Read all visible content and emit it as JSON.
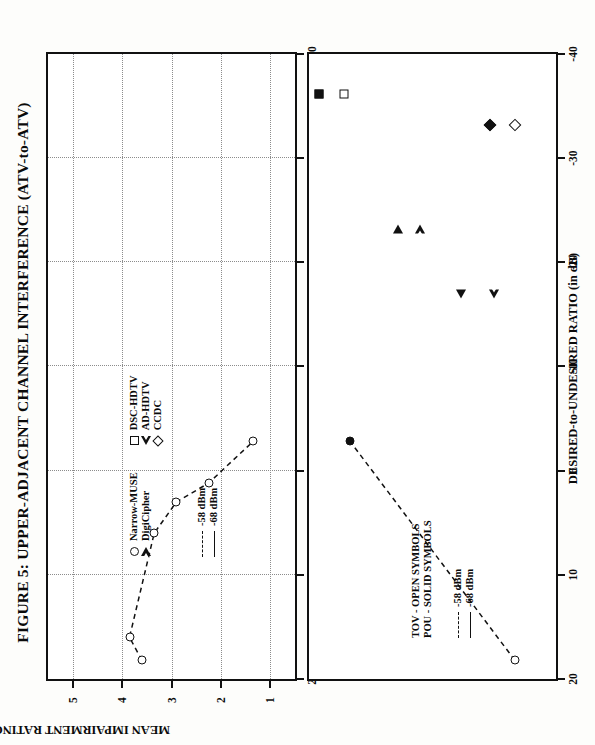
{
  "figure": {
    "title": "FIGURE 5:  UPPER-ADJACENT CHANNEL INTERFERENCE (ATV-to-ATV)"
  },
  "top_panel": {
    "y_axis_title": "MEAN IMPAIRMENT RATING",
    "y_ticks": [
      "1",
      "2",
      "3",
      "4",
      "5"
    ],
    "x_ticks": [
      "20",
      "10",
      "0",
      "-10",
      "-20",
      "-30",
      "-40"
    ],
    "legend_symbols": [
      {
        "label": "Narrow-MUSE",
        "symbol": "circle-open"
      },
      {
        "label": "DigiCipher",
        "symbol": "triangle-right-open"
      },
      {
        "label": "DSC-HDTV",
        "symbol": "square-open"
      },
      {
        "label": "AD-HDTV",
        "symbol": "triangle-left-open"
      },
      {
        "label": "CCDC",
        "symbol": "diamond-open"
      }
    ],
    "legend_lines": [
      {
        "label": "-58 dBm",
        "style": "dashed"
      },
      {
        "label": "-68 dBm",
        "style": "solid"
      }
    ]
  },
  "bottom_panel": {
    "x_axis_title": "DESIRED-to-UNDESIRED RATIO (in dB)",
    "x_ticks": [
      "20",
      "10",
      "0",
      "-10",
      "-20",
      "-30",
      "-40"
    ],
    "y_ticks": [
      "1",
      "2",
      "3",
      "4",
      "5"
    ],
    "legend_notes": [
      "TOV - OPEN SYMBOLS",
      "POU - SOLID SYMBOLS"
    ],
    "legend_lines": [
      {
        "label": "-58 dBm",
        "style": "dashed"
      },
      {
        "label": "-68 dBm",
        "style": "solid"
      }
    ]
  },
  "chart_data": [
    {
      "type": "line",
      "panel": "top",
      "title": "Mean impairment rating vs desired-to-undesired ratio",
      "xlabel": "DESIRED-to-UNDESIRED RATIO (in dB)",
      "ylabel": "MEAN IMPAIRMENT RATING",
      "xlim": [
        20,
        -40
      ],
      "ylim": [
        0.5,
        5.5
      ],
      "grid": "dotted vertical and horizontal",
      "legend_position": "lower-left inside axes",
      "series": [
        {
          "name": "Narrow-MUSE -58 dBm",
          "marker": "circle-open",
          "line": "dashed",
          "points": [
            {
              "x": 18.2,
              "y": 3.6
            },
            {
              "x": 16.0,
              "y": 3.85
            },
            {
              "x": 6.0,
              "y": 3.35
            },
            {
              "x": 3.0,
              "y": 2.9
            },
            {
              "x": 1.2,
              "y": 2.25
            },
            {
              "x": -2.8,
              "y": 1.35
            }
          ]
        }
      ]
    },
    {
      "type": "scatter",
      "panel": "bottom",
      "title": "TOV and POU thresholds vs desired-to-undesired ratio",
      "xlabel": "DESIRED-to-UNDESIRED RATIO (in dB)",
      "ylabel": "",
      "xlim": [
        20,
        -40
      ],
      "ylim": [
        0,
        6
      ],
      "grid": "off",
      "legend_position": "lower-left inside axes",
      "series": [
        {
          "name": "Narrow-MUSE",
          "marker_open": "circle-open",
          "marker_solid": "circle-solid",
          "line": "dashed",
          "points": [
            {
              "x": 18.2,
              "y": 1.0,
              "kind": "TOV"
            },
            {
              "x": -2.8,
              "y": 5.0,
              "kind": "POU"
            }
          ]
        },
        {
          "name": "DigiCipher",
          "marker_open": "triangle-right-open",
          "marker_solid": "triangle-right-solid",
          "points": [
            {
              "x": -23.2,
              "y": 3.3,
              "kind": "TOV"
            },
            {
              "x": -23.2,
              "y": 3.85,
              "kind": "POU"
            }
          ]
        },
        {
          "name": "AD-HDTV",
          "marker_open": "triangle-left-open",
          "marker_solid": "triangle-left-solid",
          "points": [
            {
              "x": -17.0,
              "y": 1.75,
              "kind": "TOV"
            },
            {
              "x": -17.0,
              "y": 2.3,
              "kind": "POU"
            }
          ]
        },
        {
          "name": "DSC-HDTV",
          "marker_open": "square-open",
          "marker_solid": "square-solid",
          "points": [
            {
              "x": -36.2,
              "y": 5.15,
              "kind": "TOV"
            },
            {
              "x": -36.2,
              "y": 5.75,
              "kind": "POU"
            }
          ]
        },
        {
          "name": "CCDC",
          "marker_open": "diamond-open",
          "marker_solid": "diamond-solid",
          "points": [
            {
              "x": -33.2,
              "y": 1.0,
              "kind": "TOV"
            },
            {
              "x": -33.2,
              "y": 1.6,
              "kind": "POU"
            }
          ]
        }
      ]
    }
  ]
}
